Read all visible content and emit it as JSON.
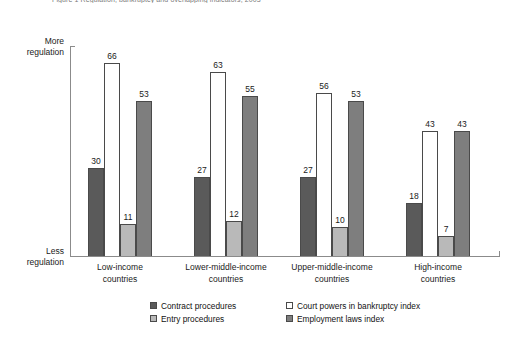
{
  "figure": {
    "title": "Figure 1  Regulation, bankruptcy and overlapping indicators, 2003"
  },
  "axis": {
    "y_top_label": "More\nregulation",
    "y_top_line1": "More",
    "y_top_line2": "regulation",
    "y_bottom_line1": "Less",
    "y_bottom_line2": "regulation"
  },
  "colors": {
    "series1": "#5a5a5a",
    "series2": "#ffffff",
    "series3": "#b9b9b9",
    "series4": "#7e7e7e",
    "bar_outline": "#4a4a4a",
    "axis": "#8b8b8b",
    "text": "#1a1a1a",
    "title": "#7a7a7a"
  },
  "chart_data": {
    "type": "bar",
    "title": "Figure 1  Regulation, bankruptcy and overlapping indicators, 2003",
    "xlabel": "",
    "ylabel": "Regulation",
    "ylim": [
      0,
      72
    ],
    "grid": false,
    "legend_position": "bottom",
    "categories": [
      "Low-income countries",
      "Lower-middle-income countries",
      "Upper-middle-income countries",
      "High-income countries"
    ],
    "categories_lines": [
      [
        "Low-income",
        "countries"
      ],
      [
        "Lower-middle-income",
        "countries"
      ],
      [
        "Upper-middle-income",
        "countries"
      ],
      [
        "High-income",
        "countries"
      ]
    ],
    "series": [
      {
        "name": "Contract procedures",
        "color": "#5a5a5a",
        "values": [
          30,
          27,
          27,
          18
        ]
      },
      {
        "name": "Court powers in bankruptcy index",
        "color": "#ffffff",
        "values": [
          66,
          63,
          56,
          43
        ]
      },
      {
        "name": "Entry procedures",
        "color": "#b9b9b9",
        "values": [
          11,
          12,
          10,
          7
        ]
      },
      {
        "name": "Employment laws index",
        "color": "#7e7e7e",
        "values": [
          53,
          55,
          53,
          43
        ]
      }
    ]
  },
  "legend": {
    "items": [
      {
        "label": "Contract procedures",
        "color": "#5a5a5a"
      },
      {
        "label": "Court powers in bankruptcy index",
        "color": "#ffffff"
      },
      {
        "label": "Entry procedures",
        "color": "#b9b9b9"
      },
      {
        "label": "Employment laws index",
        "color": "#7e7e7e"
      }
    ]
  }
}
